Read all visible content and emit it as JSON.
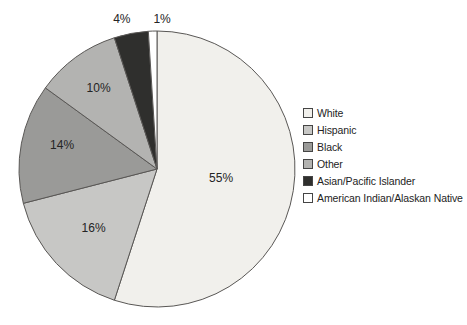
{
  "chart_data": {
    "type": "pie",
    "title": "",
    "legend_position": "right",
    "direction": "clockwise",
    "start_angle_deg": 0,
    "stroke_color": "#595755",
    "label_color": "#242424",
    "slices": [
      {
        "label": "White",
        "value": 55,
        "display": "55%",
        "color": "#f1f0ec",
        "label_pos": "inside",
        "label_r_frac": 0.47,
        "label_dx": 0,
        "label_dy": 0
      },
      {
        "label": "Hispanic",
        "value": 16,
        "display": "16%",
        "color": "#c7c7c5",
        "label_pos": "inside",
        "label_r_frac": 0.63,
        "label_dx": 0,
        "label_dy": 0
      },
      {
        "label": "Black",
        "value": 14,
        "display": "14%",
        "color": "#9a9a98",
        "label_pos": "inside",
        "label_r_frac": 0.7,
        "label_dx": 0,
        "label_dy": -5
      },
      {
        "label": "Other",
        "value": 10,
        "display": "10%",
        "color": "#b3b3b1",
        "label_pos": "inside",
        "label_r_frac": 0.72,
        "label_dx": 0,
        "label_dy": 0
      },
      {
        "label": "Asian/Pacific Islander",
        "value": 4,
        "display": "4%",
        "color": "#2f2f2d",
        "label_pos": "outside",
        "label_r_frac": 1.13,
        "label_dx": -6,
        "label_dy": 4
      },
      {
        "label": "American Indian/Alaskan Native",
        "value": 1,
        "display": "1%",
        "color": "#ffffff",
        "label_pos": "outside",
        "label_r_frac": 1.12,
        "label_dx": 10,
        "label_dy": 5
      }
    ]
  }
}
